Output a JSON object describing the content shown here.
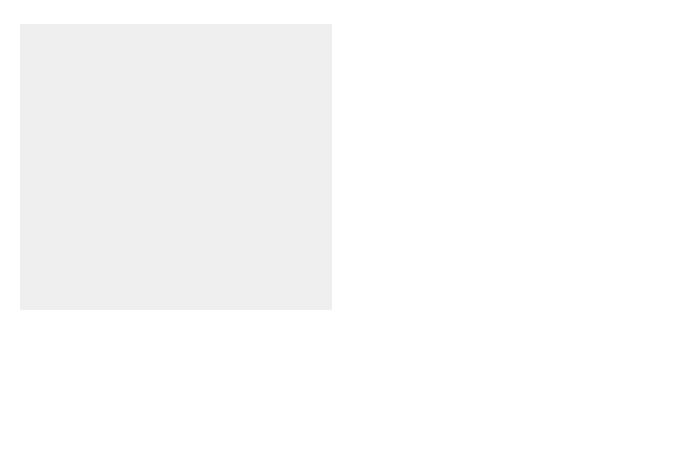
{
  "diagram": {
    "colors": {
      "panel_background": "#efefef",
      "streamline": "#9a9a9a",
      "airfoil_outline": "#b0b0b0",
      "lift_arrow_fill": "#a9a9a9",
      "pointer_line": "#111111",
      "text": "#1a1a1a"
    },
    "lift_arrow": {
      "label": "lift",
      "direction": "up"
    },
    "streamlines": {
      "count": 7,
      "arrowhead": "triangle-right",
      "flow_direction": "left-to-right"
    },
    "airfoil": {
      "shape": "curved wing cross-section",
      "leading_edge": "left",
      "trailing_edge": "right"
    },
    "callouts": [
      {
        "id": "curved-wing",
        "line1": "curved wing",
        "line2": "shape"
      },
      {
        "id": "high-pressure",
        "line1": "high air pressure",
        "line2": "below"
      },
      {
        "id": "low-pressure",
        "line1": "low air pressure",
        "line2": "on top"
      }
    ]
  }
}
